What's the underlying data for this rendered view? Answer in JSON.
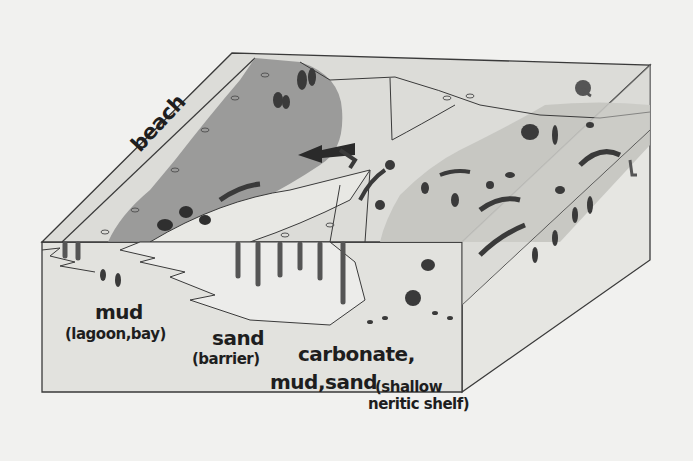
{
  "diagram": {
    "type": "block-diagram",
    "labels": {
      "beach": "beach",
      "mud": "mud",
      "mud_sub": "(lagoon,bay)",
      "sand": "sand",
      "sand_sub": "(barrier)",
      "carbonate_line1": "carbonate,",
      "carbonate_line2": "mud,sand",
      "shelf_sub_line1": "(shallow",
      "shelf_sub_line2": "neritic shelf)"
    },
    "colors": {
      "background": "#f1f1ef",
      "outline": "#3a3a3a",
      "lagoon": "#8f8f8f",
      "light_surface": "#dcdcd8",
      "shelf_surface": "#c4c4c0",
      "front_face": "#e2e2de",
      "ink": "#2a2a2a"
    },
    "icons": [
      "arrow-left-icon",
      "ammonite-icon",
      "coral-icon",
      "plant-icon",
      "burrow-icon"
    ]
  }
}
